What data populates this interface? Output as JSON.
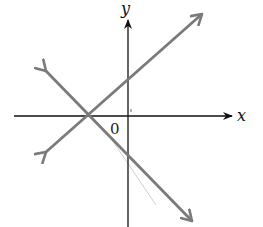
{
  "diagram": {
    "type": "coordinate-plane-two-lines",
    "axes": {
      "x_label": "x",
      "y_label": "y",
      "origin_label": "0"
    },
    "lines": [
      {
        "name": "line-positive-slope",
        "description": "rising line crossing negative x-axis and positive y-intercept"
      },
      {
        "name": "line-negative-slope",
        "description": "falling line crossing the same x-intercept and negative y-intercept"
      }
    ],
    "intersection": "both lines intersect on the negative x-axis",
    "colors": {
      "axis": "#111111",
      "lines": "#7a7a7a",
      "faint_line": "#c8c8c8"
    }
  }
}
